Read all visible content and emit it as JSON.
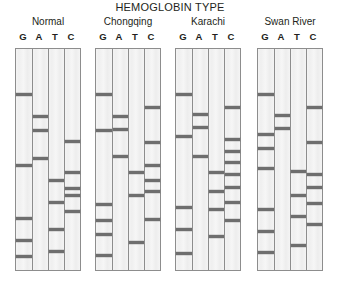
{
  "figure": {
    "title": "HEMOGLOBIN TYPE",
    "lane_labels": [
      "G",
      "A",
      "T",
      "C"
    ]
  },
  "chart_data": {
    "type": "table",
    "title": "HEMOGLOBIN TYPE",
    "subtitle": "",
    "xlabel": "",
    "ylabel": "",
    "grid": false,
    "legend_position": "none",
    "lane_labels": [
      "G",
      "A",
      "T",
      "C"
    ],
    "band_position_units": "percent of gel height from top (0 = top of gel, 100 = bottom of gel)",
    "panels": [
      {
        "name": "Normal",
        "lanes": [
          {
            "base": "G",
            "bands": [
              20.5,
              52.5,
              76.5,
              86.5,
              94.0
            ]
          },
          {
            "base": "A",
            "bands": [
              30.5,
              37.0,
              49.5
            ]
          },
          {
            "base": "T",
            "bands": [
              59.5,
              69.5,
              81.5,
              91.5
            ]
          },
          {
            "base": "C",
            "bands": [
              42.0,
              56.0,
              63.0,
              66.5,
              73.5
            ]
          }
        ]
      },
      {
        "name": "Chongqing",
        "lanes": [
          {
            "base": "G",
            "bands": [
              20.5,
              37.0,
              70.5,
              77.5,
              84.0,
              93.5
            ]
          },
          {
            "base": "A",
            "bands": [
              30.5,
              36.5,
              48.5
            ]
          },
          {
            "base": "T",
            "bands": [
              56.0,
              66.5,
              87.5
            ]
          },
          {
            "base": "C",
            "bands": [
              26.5,
              42.5,
              52.5,
              59.5,
              64.5,
              77.0
            ]
          }
        ]
      },
      {
        "name": "Karachi",
        "lanes": [
          {
            "base": "G",
            "bands": [
              20.5,
              39.5,
              71.5,
              81.5,
              92.5
            ]
          },
          {
            "base": "A",
            "bands": [
              29.5,
              35.5,
              48.5
            ]
          },
          {
            "base": "T",
            "bands": [
              56.0,
              64.5,
              72.5,
              85.0
            ]
          },
          {
            "base": "C",
            "bands": [
              26.5,
              41.0,
              46.5,
              51.5,
              57.0,
              62.5,
              69.5,
              77.5
            ]
          }
        ]
      },
      {
        "name": "Swan River",
        "lanes": [
          {
            "base": "G",
            "bands": [
              20.5,
              38.5,
              45.0,
              54.0,
              72.5,
              82.5,
              92.0
            ]
          },
          {
            "base": "A",
            "bands": [
              30.0,
              36.0
            ]
          },
          {
            "base": "T",
            "bands": [
              55.5,
              66.5,
              76.0,
              89.0
            ]
          },
          {
            "base": "C",
            "bands": [
              26.5,
              42.5,
              57.0,
              62.5,
              70.0,
              79.5
            ]
          }
        ]
      }
    ]
  }
}
